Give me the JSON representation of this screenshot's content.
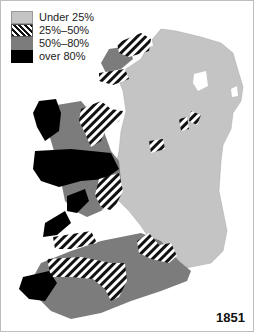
{
  "legend": {
    "items": [
      {
        "label": "Under 25%",
        "color": "#c4c4c4",
        "pattern": "solid"
      },
      {
        "label": "25%–50%",
        "color": "#ffffff",
        "pattern": "diagonal-stripes"
      },
      {
        "label": "50%–80%",
        "color": "#7c7c7c",
        "pattern": "solid"
      },
      {
        "label": "over 80%",
        "color": "#000000",
        "pattern": "solid"
      }
    ]
  },
  "map": {
    "subject": "Ireland",
    "year": "1851"
  }
}
